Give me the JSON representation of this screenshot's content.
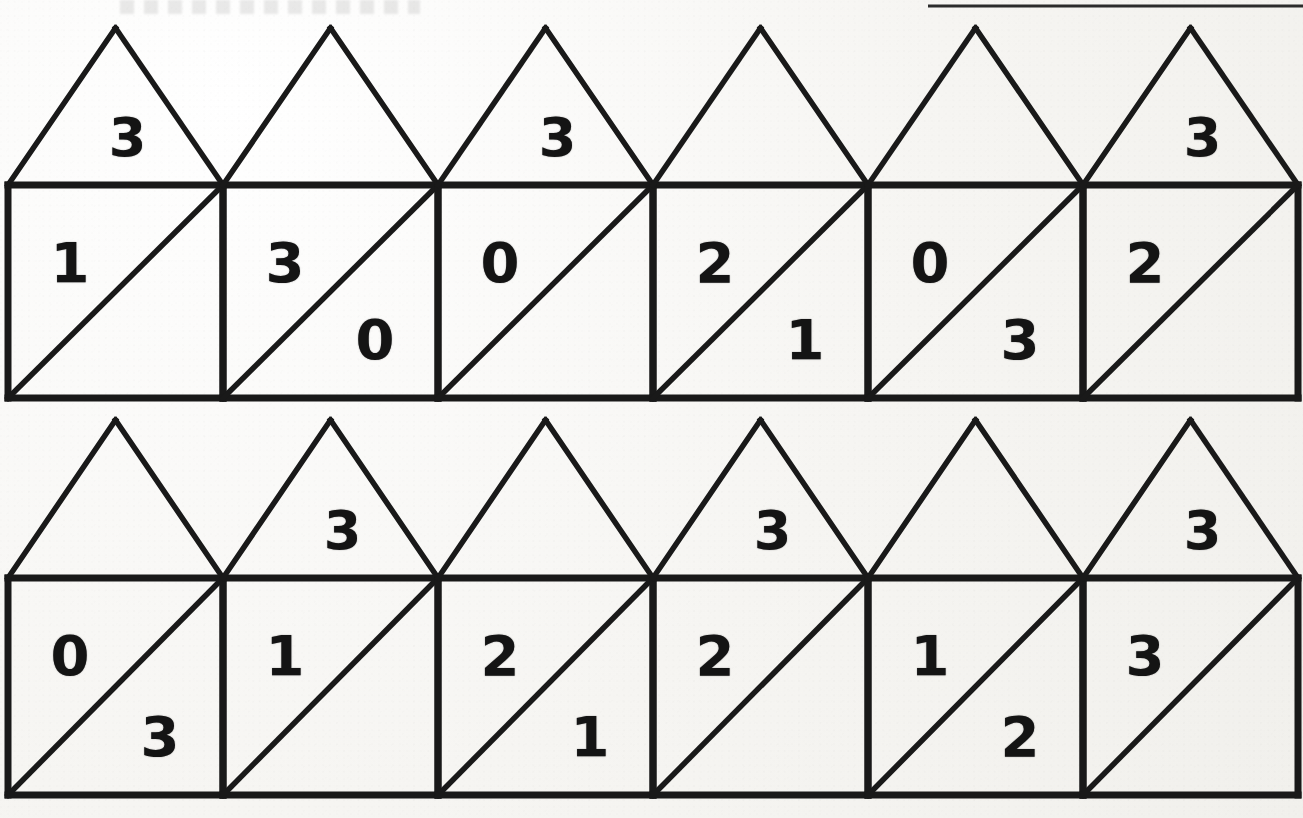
{
  "worksheet": {
    "title": "",
    "paper_color": "#f6f5f2",
    "ink_color": "#191919",
    "top_rule_label": "top-rule",
    "shape_name": "house",
    "rows": [
      {
        "row_label": "row-1",
        "houses": [
          {
            "index": 1,
            "roof": "3",
            "upper_left": "1",
            "lower_right": ""
          },
          {
            "index": 2,
            "roof": "",
            "upper_left": "3",
            "lower_right": "0"
          },
          {
            "index": 3,
            "roof": "3",
            "upper_left": "0",
            "lower_right": ""
          },
          {
            "index": 4,
            "roof": "",
            "upper_left": "2",
            "lower_right": "1"
          },
          {
            "index": 5,
            "roof": "",
            "upper_left": "0",
            "lower_right": "3"
          },
          {
            "index": 6,
            "roof": "3",
            "upper_left": "2",
            "lower_right": ""
          }
        ]
      },
      {
        "row_label": "row-2",
        "houses": [
          {
            "index": 1,
            "roof": "",
            "upper_left": "0",
            "lower_right": "3"
          },
          {
            "index": 2,
            "roof": "3",
            "upper_left": "1",
            "lower_right": ""
          },
          {
            "index": 3,
            "roof": "",
            "upper_left": "2",
            "lower_right": "1"
          },
          {
            "index": 4,
            "roof": "3",
            "upper_left": "2",
            "lower_right": ""
          },
          {
            "index": 5,
            "roof": "",
            "upper_left": "1",
            "lower_right": "2"
          },
          {
            "index": 6,
            "roof": "3",
            "upper_left": "3",
            "lower_right": ""
          }
        ]
      }
    ]
  }
}
